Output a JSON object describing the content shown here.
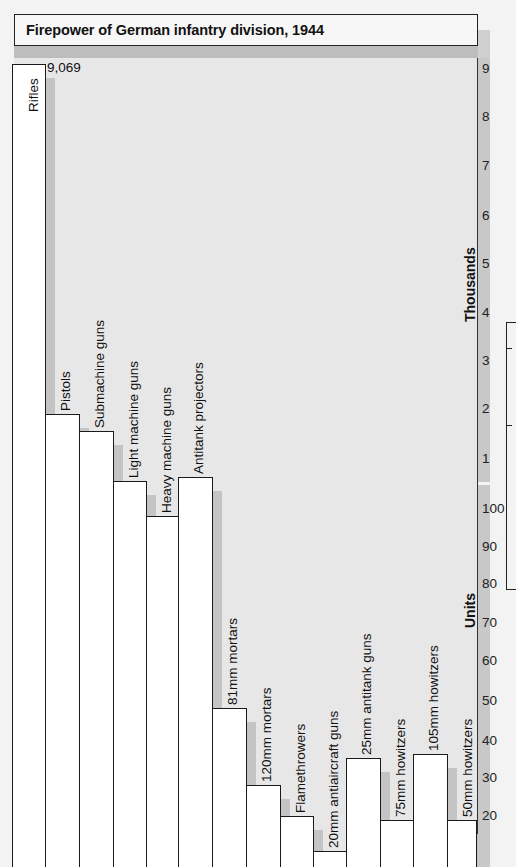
{
  "title": "Firepower of German infantry division, 1944",
  "axis": {
    "thousands_label": "Thousands",
    "units_label": "Units",
    "thousands_ticks": [
      "9",
      "8",
      "7",
      "6",
      "5",
      "4",
      "3",
      "2",
      "1"
    ],
    "units_ticks": [
      "100",
      "90",
      "80",
      "70",
      "60",
      "50",
      "40",
      "30",
      "20"
    ]
  },
  "rifles_value_label": "9,069",
  "chart_data": {
    "type": "bar",
    "title": "Firepower of German infantry division, 1944",
    "xlabel": "",
    "ylabel": "Thousands (upper scale) / Units (lower scale, broken axis)",
    "axis_note": "Broken y-axis: upper segment in thousands (1-9), lower segment in units (20-100)",
    "categories": [
      "Rifles",
      "Pistols",
      "Submachine guns",
      "Light machine guns",
      "Heavy machine guns",
      "Antitank projectors",
      "81mm mortars",
      "120mm mortars",
      "Flamethrowers",
      "20mm antiaircraft guns",
      "25mm antitank guns",
      "75mm howitzers",
      "105mm howitzers",
      "50mm howitzers"
    ],
    "values": [
      9069,
      1900,
      1550,
      530,
      98,
      108,
      48,
      28,
      20,
      11,
      35,
      19,
      36,
      19
    ],
    "data_labels": {
      "Rifles": "9,069"
    },
    "ylim_thousands": [
      0.5,
      9.2
    ],
    "ylim_units": [
      0,
      110
    ],
    "grid": false,
    "legend": null
  }
}
